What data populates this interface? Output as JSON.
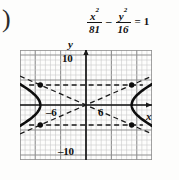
{
  "problem_label": ")",
  "equation": {
    "term1": {
      "numerator": "x",
      "numerator_exp": "2",
      "denominator": "81"
    },
    "operator": "–",
    "term2": {
      "numerator": "y",
      "numerator_exp": "2",
      "denominator": "16"
    },
    "equals": "=",
    "rhs": "1"
  },
  "chart_data": {
    "type": "line",
    "title": "",
    "subtitle": "",
    "xlabel": "x",
    "ylabel": "y",
    "curve_kind": "hyperbola",
    "equation_text": "x^2/81 - y^2/16 = 1",
    "a": 9,
    "b": 4,
    "center": [
      0,
      0
    ],
    "vertices": [
      [
        -9,
        0
      ],
      [
        9,
        0
      ]
    ],
    "transverse_axis": "horizontal",
    "asymptote_slopes": [
      0.4444,
      -0.4444
    ],
    "asymptotes_text": [
      "y = (4/9)x",
      "y = -(4/9)x"
    ],
    "rectangle_corners": [
      [
        -9,
        4
      ],
      [
        9,
        4
      ],
      [
        9,
        -4
      ],
      [
        -9,
        -4
      ]
    ],
    "marked_points": [
      [
        -9,
        4
      ],
      [
        9,
        4
      ],
      [
        9,
        -4
      ],
      [
        -9,
        -4
      ]
    ],
    "xlim": [
      -13,
      13
    ],
    "ylim": [
      -11,
      11
    ],
    "grid": true,
    "grid_step": 1,
    "major_grid_step": 5,
    "tick_labels": {
      "y_top": "10",
      "y_bottom": "–10",
      "x_left": "–6",
      "x_right": "6"
    },
    "legend": "none",
    "annotations": []
  },
  "colors": {
    "background": "#fdfdfc",
    "grid_minor": "#c9c9c9",
    "grid_major": "#8f8f8f",
    "axis": "#1a1a1a",
    "curve": "#0d0d0d",
    "asymptote": "#1a1a1a",
    "text": "#111111"
  }
}
